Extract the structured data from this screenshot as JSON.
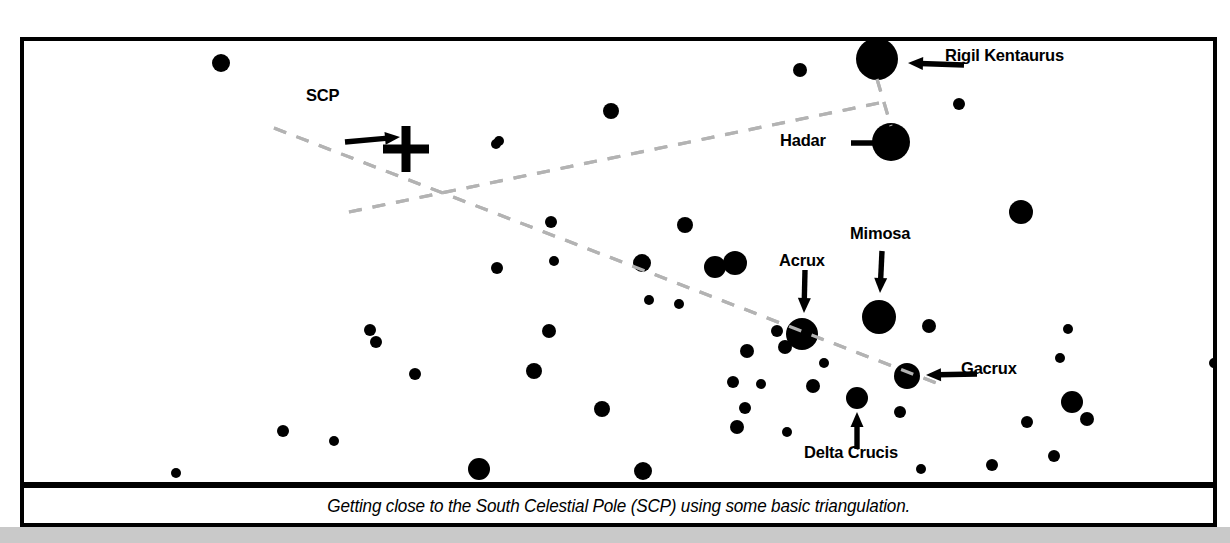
{
  "figure": {
    "caption": "Getting close to the South Celestial Pole (SCP) using some basic triangulation.",
    "background_color": "#ffffff",
    "star_color": "#000000",
    "frame_color": "#000000",
    "guide_line_color": "#b3b3b3",
    "page_strip_color": "#c9c9c9"
  },
  "labels": [
    {
      "name": "scp",
      "text": "SCP",
      "x": 302,
      "y": 92,
      "arrow": "down-right"
    },
    {
      "name": "rigil-kentaurus",
      "text": "Rigil Kentaurus",
      "x": 941,
      "y": 52,
      "arrow": "left"
    },
    {
      "name": "hadar",
      "text": "Hadar",
      "x": 776,
      "y": 137,
      "arrow": "right"
    },
    {
      "name": "mimosa",
      "text": "Mimosa",
      "x": 846,
      "y": 230,
      "arrow": "down"
    },
    {
      "name": "acrux",
      "text": "Acrux",
      "x": 775,
      "y": 257,
      "arrow": "down"
    },
    {
      "name": "gacrux",
      "text": "Gacrux",
      "x": 957,
      "y": 365,
      "arrow": "left"
    },
    {
      "name": "delta-crucis",
      "text": "Delta Crucis",
      "x": 800,
      "y": 449,
      "arrow": "up"
    }
  ],
  "chart_data": {
    "type": "scatter",
    "title": "Getting close to the South Celestial Pole (SCP) using some basic triangulation.",
    "xlabel": "",
    "ylabel": "",
    "grid": false,
    "legend": "none",
    "xlim": [
      0,
      1189
    ],
    "ylim": [
      0,
      441
    ],
    "marker_shape": "filled-circle",
    "named_stars": [
      {
        "name": "Rigil Kentaurus",
        "x": 853,
        "y": 18,
        "r": 21,
        "magnitude_rank": 1
      },
      {
        "name": "Hadar",
        "x": 867,
        "y": 101,
        "r": 19,
        "magnitude_rank": 2
      },
      {
        "name": "Mimosa",
        "x": 855,
        "y": 276,
        "r": 17,
        "magnitude_rank": 3
      },
      {
        "name": "Acrux",
        "x": 778,
        "y": 293,
        "r": 16,
        "magnitude_rank": 4
      },
      {
        "name": "Gacrux",
        "x": 883,
        "y": 335,
        "r": 13,
        "magnitude_rank": 5
      },
      {
        "name": "Delta Crucis",
        "x": 833,
        "y": 357,
        "r": 11,
        "magnitude_rank": 6
      }
    ],
    "field_stars": [
      {
        "x": 197,
        "y": 22,
        "r": 9
      },
      {
        "x": 776,
        "y": 29,
        "r": 7
      },
      {
        "x": 935,
        "y": 63,
        "r": 6
      },
      {
        "x": 587,
        "y": 70,
        "r": 8
      },
      {
        "x": 475,
        "y": 100,
        "r": 5
      },
      {
        "x": 472,
        "y": 103,
        "r": 5
      },
      {
        "x": 997,
        "y": 171,
        "r": 12
      },
      {
        "x": 527,
        "y": 181,
        "r": 6
      },
      {
        "x": 661,
        "y": 184,
        "r": 8
      },
      {
        "x": 530,
        "y": 220,
        "r": 5
      },
      {
        "x": 618,
        "y": 222,
        "r": 9
      },
      {
        "x": 473,
        "y": 227,
        "r": 6
      },
      {
        "x": 691,
        "y": 226,
        "r": 11
      },
      {
        "x": 711,
        "y": 222,
        "r": 12
      },
      {
        "x": 625,
        "y": 259,
        "r": 5
      },
      {
        "x": 655,
        "y": 263,
        "r": 5
      },
      {
        "x": 905,
        "y": 285,
        "r": 7
      },
      {
        "x": 346,
        "y": 289,
        "r": 6
      },
      {
        "x": 352,
        "y": 301,
        "r": 6
      },
      {
        "x": 525,
        "y": 290,
        "r": 7
      },
      {
        "x": 723,
        "y": 310,
        "r": 7
      },
      {
        "x": 761,
        "y": 306,
        "r": 7
      },
      {
        "x": 753,
        "y": 290,
        "r": 6
      },
      {
        "x": 1036,
        "y": 317,
        "r": 5
      },
      {
        "x": 1044,
        "y": 288,
        "r": 5
      },
      {
        "x": 800,
        "y": 322,
        "r": 5
      },
      {
        "x": 709,
        "y": 341,
        "r": 6
      },
      {
        "x": 391,
        "y": 333,
        "r": 6
      },
      {
        "x": 510,
        "y": 330,
        "r": 8
      },
      {
        "x": 737,
        "y": 343,
        "r": 5
      },
      {
        "x": 721,
        "y": 367,
        "r": 6
      },
      {
        "x": 876,
        "y": 371,
        "r": 6
      },
      {
        "x": 789,
        "y": 345,
        "r": 7
      },
      {
        "x": 1048,
        "y": 361,
        "r": 11
      },
      {
        "x": 1063,
        "y": 378,
        "r": 7
      },
      {
        "x": 1003,
        "y": 381,
        "r": 6
      },
      {
        "x": 713,
        "y": 386,
        "r": 7
      },
      {
        "x": 259,
        "y": 390,
        "r": 6
      },
      {
        "x": 578,
        "y": 368,
        "r": 8
      },
      {
        "x": 763,
        "y": 391,
        "r": 5
      },
      {
        "x": 310,
        "y": 400,
        "r": 5
      },
      {
        "x": 1030,
        "y": 415,
        "r": 6
      },
      {
        "x": 968,
        "y": 424,
        "r": 6
      },
      {
        "x": 897,
        "y": 428,
        "r": 5
      },
      {
        "x": 455,
        "y": 428,
        "r": 11
      },
      {
        "x": 619,
        "y": 430,
        "r": 9
      },
      {
        "x": 1190,
        "y": 322,
        "r": 5
      },
      {
        "x": 152,
        "y": 432,
        "r": 5
      }
    ],
    "scp_marker": {
      "type": "cross",
      "x": 382,
      "y": 108,
      "size": 46,
      "thickness": 9
    },
    "guide_lines": [
      {
        "name": "pointer-line-crux",
        "from": [
          250,
          87
        ],
        "to": [
          920,
          345
        ],
        "comment": "long line running from upper-left through Acrux and Gacrux"
      },
      {
        "name": "pointer-line-alpha-beta-cen",
        "from": [
          325,
          171
        ],
        "to": [
          855,
          62
        ],
        "comment": "perpendicular bisector line from Rigil Kentaurus / Hadar midpoint"
      },
      {
        "name": "rigil-hadar-join",
        "from": [
          853,
          38
        ],
        "to": [
          867,
          85
        ],
        "comment": "short dashed join between Rigil Kentaurus and Hadar"
      }
    ]
  }
}
